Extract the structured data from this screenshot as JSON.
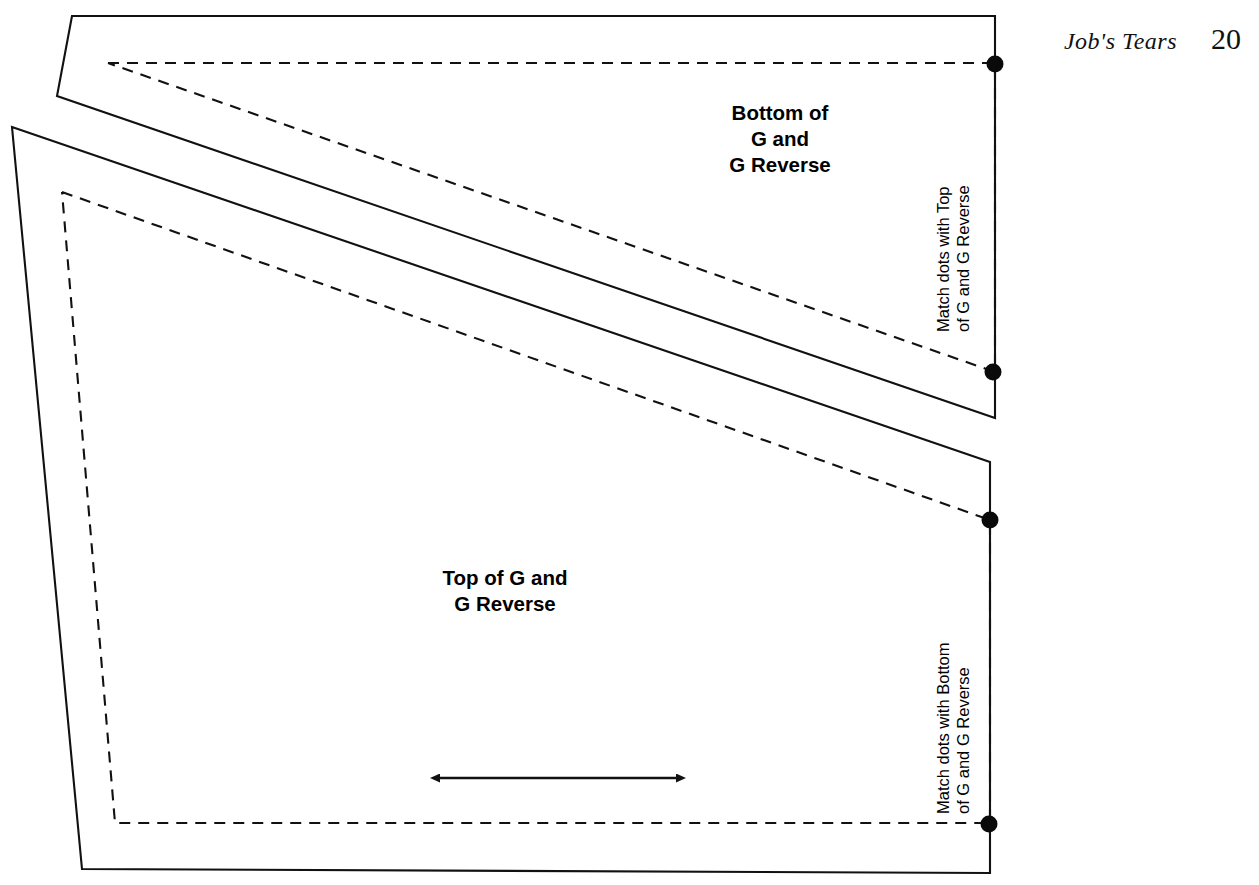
{
  "page": {
    "book_title": "Job's Tears",
    "page_number": "20",
    "background_color": "#ffffff",
    "ink_color": "#1a1a1a"
  },
  "pieces": [
    {
      "id": "bottom-g",
      "label": "Bottom of\nG and\nG Reverse",
      "match_note": "Match dots with Top\nof G and G Reverse"
    },
    {
      "id": "top-g",
      "label": "Top of G and\nG Reverse",
      "match_note": "Match dots with Bottom\nof G and G Reverse"
    }
  ],
  "markings": {
    "grainline_name": "grainline-double-arrow",
    "match_dot_name": "match-dot",
    "cut_line_style": "solid",
    "seam_line_style": "dashed",
    "dot_count": 4
  },
  "geometry": {
    "upper_piece_cut": "72,16 995,16 995,418 57,96",
    "upper_piece_seam": "108,63 995,63 995,372",
    "lower_piece_cut": "12,127 990,462 990,873 82,869",
    "lower_piece_seam": "62,192 990,520 990,823 115,823",
    "grainline": {
      "x1": 440,
      "y1": 778,
      "x2": 676,
      "y2": 778
    },
    "dots": [
      {
        "cx": 995,
        "cy": 64
      },
      {
        "cx": 993,
        "cy": 372
      },
      {
        "cx": 990,
        "cy": 520
      },
      {
        "cx": 989,
        "cy": 824
      }
    ]
  }
}
